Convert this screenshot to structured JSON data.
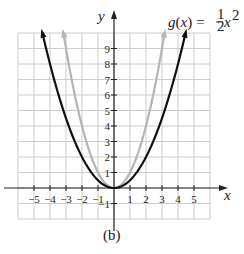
{
  "chart_data": {
    "type": "line",
    "title": "",
    "caption": "(b)",
    "xlabel": "x",
    "ylabel": "y",
    "xlim": [
      -6,
      6
    ],
    "ylim": [
      -2,
      10
    ],
    "grid": true,
    "x_ticks": [
      -5,
      -4,
      -3,
      -2,
      -1,
      1,
      2,
      3,
      4,
      5
    ],
    "x_tick_labels": [
      "−5",
      "−4",
      "−3",
      "−2",
      "−1",
      "1",
      "2",
      "3",
      "4",
      "5"
    ],
    "y_ticks": [
      -1,
      1,
      2,
      3,
      4,
      5,
      6,
      7,
      8,
      9
    ],
    "y_tick_labels": [
      "−1",
      "1",
      "2",
      "3",
      "4",
      "5",
      "6",
      "7",
      "8",
      "9"
    ],
    "series": [
      {
        "name": "g(x) = 1/2 x^2",
        "color": "#111111",
        "function": "0.5*x^2",
        "x": [
          -4.47,
          -4,
          -3,
          -2,
          -1,
          0,
          1,
          2,
          3,
          4,
          4.47
        ],
        "y": [
          10,
          8,
          4.5,
          2,
          0.5,
          0,
          0.5,
          2,
          4.5,
          8,
          10
        ]
      },
      {
        "name": "f(x) = x^2",
        "color": "#b5b5b5",
        "function": "x^2",
        "x": [
          -3.16,
          -3,
          -2,
          -1,
          0,
          1,
          2,
          3,
          3.16
        ],
        "y": [
          10,
          9,
          4,
          1,
          0,
          1,
          4,
          9,
          10
        ]
      }
    ],
    "annotations": [
      {
        "text": "g(x) = ½x²",
        "near": "top-right, labeling black curve"
      }
    ]
  },
  "labels": {
    "y_axis": "y",
    "x_axis": "x",
    "equation_lhs": "g(x) = ",
    "equation_num": "1",
    "equation_den": "2",
    "equation_var": "x",
    "equation_exp": "2",
    "caption": "(b)"
  },
  "colors": {
    "grid": "#cccccc",
    "axis": "#222222",
    "black_curve": "#111111",
    "gray_curve": "#b5b5b5"
  }
}
